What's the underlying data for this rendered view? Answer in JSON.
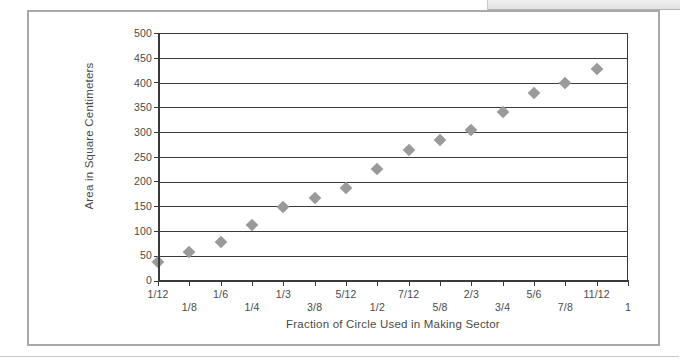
{
  "figure": {
    "background_color": "#ffffff",
    "frame_color": "#a9a9a9",
    "marker_color": "#9a9a9a",
    "axis_color": "#3a3a3a",
    "text_color": "#4a4a4a"
  },
  "chart_data": {
    "type": "scatter",
    "title": "",
    "xlabel": "Fraction of Circle Used in Making Sector",
    "ylabel": "Area in Square Centimeters",
    "categories": [
      "1/12",
      "1/8",
      "1/6",
      "1/4",
      "1/3",
      "3/8",
      "5/12",
      "1/2",
      "7/12",
      "5/8",
      "2/3",
      "3/4",
      "5/6",
      "7/8",
      "11/12",
      "1"
    ],
    "values": [
      38,
      58,
      78,
      113,
      150,
      168,
      188,
      226,
      264,
      284,
      304,
      341,
      379,
      400,
      427,
      null
    ],
    "x": [
      0.0833,
      0.125,
      0.1667,
      0.25,
      0.3333,
      0.375,
      0.4167,
      0.5,
      0.5833,
      0.625,
      0.6667,
      0.75,
      0.8333,
      0.875,
      0.9167,
      1.0
    ],
    "ylim": [
      0,
      500
    ],
    "xlim": [
      0,
      1
    ],
    "yticks": [
      0,
      50,
      100,
      150,
      200,
      250,
      300,
      350,
      400,
      450,
      500
    ],
    "ytick_labels": [
      "0",
      "50",
      "100",
      "150",
      "200",
      "250",
      "300",
      "350",
      "400",
      "450",
      "500"
    ],
    "grid": true,
    "grid_axis": "y",
    "legend": false,
    "marker": "diamond",
    "marker_color": "#9a9a9a"
  }
}
